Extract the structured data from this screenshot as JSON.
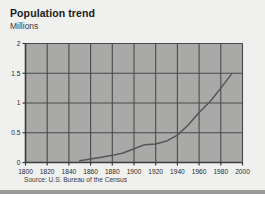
{
  "card": {
    "title": "Population trend",
    "source": "Source: U.S. Bureau of the Census"
  },
  "chart_data": {
    "type": "line",
    "title": "Population trend",
    "subtitle": "",
    "xlabel": "",
    "ylabel": "Millions",
    "xlim": [
      1800,
      2000
    ],
    "ylim": [
      0,
      2
    ],
    "xticks": [
      1800,
      1820,
      1840,
      1860,
      1880,
      1900,
      1920,
      1940,
      1960,
      1980,
      2000
    ],
    "yticks": [
      0,
      0.5,
      1,
      1.5,
      2
    ],
    "ytick_labels": [
      "0",
      "0.5",
      "1",
      "1.5",
      "2"
    ],
    "xtick_labels": [
      "1800",
      "1820",
      "1840",
      "1860",
      "1880",
      "1900",
      "1920",
      "1940",
      "1960",
      "1980",
      "2000"
    ],
    "grid": true,
    "legend": false,
    "annotation": "Source: U.S. Bureau of the Census",
    "series": [
      {
        "name": "Population",
        "x": [
          1850,
          1860,
          1870,
          1880,
          1890,
          1900,
          1910,
          1920,
          1930,
          1940,
          1950,
          1960,
          1970,
          1980,
          1990
        ],
        "values": [
          0.03,
          0.06,
          0.09,
          0.12,
          0.16,
          0.23,
          0.3,
          0.31,
          0.36,
          0.46,
          0.63,
          0.84,
          1.02,
          1.25,
          1.49
        ]
      }
    ],
    "colors": {
      "plot_background": "#a9a9a7",
      "grid": "#4a4a4a",
      "axis": "#3c3c3c",
      "line": "#555555",
      "card_background": "#f0f0ee",
      "text": "#1a1a1a"
    }
  }
}
